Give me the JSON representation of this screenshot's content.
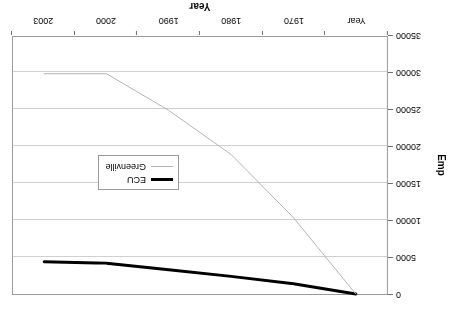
{
  "chart_data": {
    "type": "line",
    "title": "",
    "xlabel": "Year",
    "ylabel": "Emp",
    "categories": [
      "Year",
      "1970",
      "1980",
      "1990",
      "2000",
      "2003"
    ],
    "series": [
      {
        "name": "ECU",
        "color": "#000000",
        "width": 3,
        "values": [
          0,
          1400,
          2400,
          3300,
          4200,
          4400
        ]
      },
      {
        "name": "Greenville",
        "color": "#b2b2b2",
        "width": 1,
        "values": [
          0,
          10400,
          19000,
          25000,
          30000,
          30000
        ]
      }
    ],
    "ylim": [
      0,
      35000
    ],
    "yticks": [
      0,
      5000,
      10000,
      15000,
      20000,
      25000,
      30000,
      35000
    ],
    "ytick_labels": [
      "0",
      "5000",
      "10000",
      "15000",
      "20000",
      "25000",
      "30000",
      "35000"
    ],
    "grid": true,
    "legend_position": "center-left",
    "rotation_degrees": 180
  },
  "legend": {
    "entries": [
      {
        "label": "ECU"
      },
      {
        "label": "Greenville"
      }
    ]
  },
  "axes": {
    "y_title": "Emp",
    "x_title": "Year"
  }
}
